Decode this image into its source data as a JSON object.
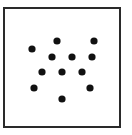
{
  "diagram": {
    "type": "dot-pattern",
    "frame": {
      "x": 3,
      "y": 7,
      "width": 118,
      "height": 121,
      "border_color": "#2a2a2a"
    },
    "dot_color": "#111111",
    "dot_radius": 3.6,
    "dot_count": 12,
    "dots": [
      {
        "x": 32,
        "y": 49
      },
      {
        "x": 57,
        "y": 41
      },
      {
        "x": 94,
        "y": 41
      },
      {
        "x": 52,
        "y": 57
      },
      {
        "x": 72,
        "y": 57
      },
      {
        "x": 92,
        "y": 57
      },
      {
        "x": 42,
        "y": 72
      },
      {
        "x": 62,
        "y": 72
      },
      {
        "x": 82,
        "y": 72
      },
      {
        "x": 34,
        "y": 88
      },
      {
        "x": 90,
        "y": 88
      },
      {
        "x": 62,
        "y": 99
      }
    ]
  }
}
